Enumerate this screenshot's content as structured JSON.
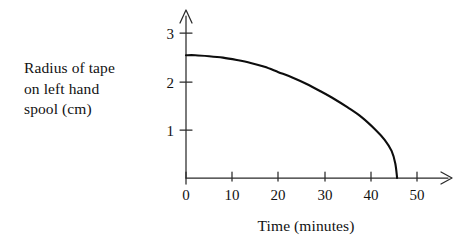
{
  "figure": {
    "background_color": "#ffffff",
    "ink_color": "#121212",
    "curve_color": "#0d0d0d"
  },
  "labels": {
    "y_caption": "Radius of tape\non left hand\nspool (cm)",
    "x_title": "Time (minutes)"
  },
  "chart_data": {
    "type": "line",
    "title": "",
    "subtitle": "",
    "xlabel": "Time (minutes)",
    "ylabel": "Radius of tape on left hand spool (cm)",
    "xlim": [
      0,
      55
    ],
    "ylim": [
      0,
      3.4
    ],
    "x_ticks": [
      0,
      10,
      20,
      30,
      40,
      50
    ],
    "x_tick_labels": [
      "0",
      "10",
      "20",
      "30",
      "40",
      "50"
    ],
    "y_ticks": [
      1,
      2,
      3
    ],
    "y_tick_labels": [
      "1",
      "2",
      "3"
    ],
    "grid": false,
    "legend": false,
    "legend_position": "none",
    "axis_arrows": true,
    "annotations": [],
    "series": [
      {
        "name": "Radius of tape on left hand spool",
        "x": [
          0,
          2,
          5,
          8,
          11,
          14,
          17,
          20,
          23,
          26,
          29,
          32,
          35,
          38,
          41,
          43,
          44.5,
          45.3,
          45.7
        ],
        "values": [
          2.54,
          2.54,
          2.52,
          2.49,
          2.44,
          2.38,
          2.3,
          2.19,
          2.08,
          1.95,
          1.8,
          1.64,
          1.46,
          1.26,
          1.0,
          0.79,
          0.56,
          0.3,
          0.0
        ]
      }
    ]
  }
}
